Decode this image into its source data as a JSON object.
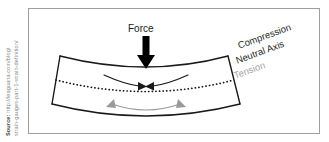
{
  "figure": {
    "type": "beam-bending-stress-diagram",
    "force_label": "Force",
    "labels": {
      "compression": "Compression",
      "neutral_axis": "Neutral Axis",
      "tension": "Tension"
    },
    "colors": {
      "beam_outline": "#1a1a1a",
      "neutral_axis_dotted": "#1a1a1a",
      "compression_arrow": "#1a1a1a",
      "tension_arrow": "#9a9a9a",
      "force_arrow": "#000000",
      "frame_border": "#9e9e9e",
      "background": "#ffffff",
      "tension_label": "#a5a5a5",
      "source_text": "#8a8a8a"
    }
  },
  "source": {
    "lead": "Source:",
    "line1": " http://leaguana.com/blog/",
    "line2": "strain-gauges-part-1-strain-definition/"
  }
}
